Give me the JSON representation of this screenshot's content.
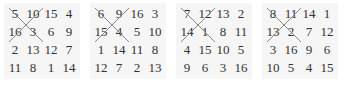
{
  "squares": [
    {
      "rows": [
        [
          "5",
          "10",
          "15",
          "4"
        ],
        [
          "16",
          "3",
          "6",
          "9"
        ],
        [
          "2",
          "13",
          "12",
          "7"
        ],
        [
          "11",
          "8",
          "1",
          "14"
        ]
      ],
      "crossed": [
        "5",
        "10",
        "16",
        "3"
      ]
    },
    {
      "rows": [
        [
          "6",
          "9",
          "16",
          "3"
        ],
        [
          "15",
          "4",
          "5",
          "10"
        ],
        [
          "1",
          "14",
          "11",
          "8"
        ],
        [
          "12",
          "7",
          "2",
          "13"
        ]
      ],
      "crossed": [
        "6",
        "9",
        "15",
        "4"
      ]
    },
    {
      "rows": [
        [
          "7",
          "12",
          "13",
          "2"
        ],
        [
          "14",
          "1",
          "8",
          "11"
        ],
        [
          "4",
          "15",
          "10",
          "5"
        ],
        [
          "9",
          "6",
          "3",
          "16"
        ]
      ],
      "crossed": [
        "7",
        "12",
        "14",
        "1"
      ]
    },
    {
      "rows": [
        [
          "8",
          "11",
          "14",
          "1"
        ],
        [
          "13",
          "2",
          "7",
          "12"
        ],
        [
          "3",
          "16",
          "9",
          "6"
        ],
        [
          "10",
          "5",
          "4",
          "15"
        ]
      ],
      "crossed": [
        "8",
        "11",
        "13",
        "2"
      ]
    }
  ]
}
